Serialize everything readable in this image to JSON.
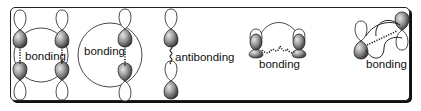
{
  "figure": {
    "type": "orbital-overlap-diagram",
    "panels": [
      {
        "id": "panel-1",
        "label": "bonding",
        "interactions": [
          "bonding",
          "bonding"
        ]
      },
      {
        "id": "panel-2",
        "labels": [
          "bonding",
          "antibonding"
        ],
        "interactions": [
          "bonding",
          "antibonding"
        ]
      },
      {
        "id": "panel-3",
        "label": "bonding",
        "interactions": [
          "bonding"
        ]
      },
      {
        "id": "panel-4",
        "label": "bonding",
        "interactions": [
          "bonding"
        ]
      }
    ]
  },
  "colors": {
    "frame": "#222222",
    "shaded_lobe_dark": "#3a3a3a",
    "shaded_lobe_light": "#cfcfcf",
    "open_lobe": "#ffffff",
    "text": "#111111"
  }
}
